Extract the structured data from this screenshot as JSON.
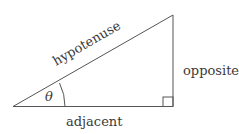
{
  "diagram": {
    "type": "right-triangle",
    "labels": {
      "hypotenuse": "hypotenuse",
      "opposite": "opposite",
      "adjacent": "adjacent",
      "angle": "θ"
    },
    "colors": {
      "stroke": "#555555",
      "text": "#3a3a3a",
      "background": "#ffffff"
    }
  }
}
